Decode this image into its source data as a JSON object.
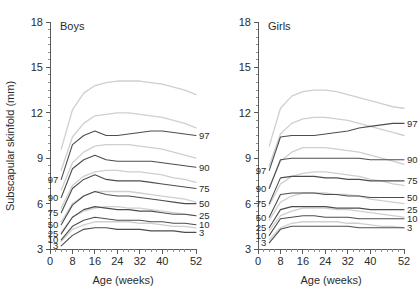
{
  "figure": {
    "ylabel": "Subscapular skinfold (mm)",
    "xlabel_boys": "Age (weeks)",
    "xlabel_girls": "Age (weeks)",
    "colors": {
      "main_curve": "#4d4d4d",
      "reference_curve": "#cfcfcf",
      "axis": "#5a5a5a",
      "text": "#2b2b2b",
      "background": "#ffffff"
    }
  },
  "panels": [
    {
      "id": "boys",
      "title": "Boys"
    },
    {
      "id": "girls",
      "title": "Girls"
    }
  ],
  "axes": {
    "y_ticks": [
      "3",
      "6",
      "9",
      "12",
      "15",
      "18"
    ],
    "y_tick_values": [
      3,
      6,
      9,
      12,
      15,
      18
    ],
    "y_minor_step": 0.5,
    "ylim": [
      3,
      18
    ],
    "x_ticks": [
      "0",
      "8",
      "16",
      "24",
      "32",
      "40",
      "52"
    ],
    "x_tick_values": [
      0,
      8,
      16,
      24,
      32,
      40,
      52
    ],
    "x_minor_step": 2,
    "xlim": [
      0,
      52
    ]
  },
  "percentile_labels": {
    "left": [
      "97",
      "90",
      "75",
      "50",
      "25",
      "10",
      "3"
    ],
    "right": [
      "97",
      "90",
      "75",
      "50",
      "25",
      "10",
      "3"
    ]
  },
  "chart_data": {
    "type": "line",
    "xlabel": "Age (weeks)",
    "ylabel": "Subscapular skinfold (mm)",
    "xlim": [
      0,
      52
    ],
    "ylim": [
      3,
      18
    ],
    "x_ticks": [
      0,
      8,
      16,
      24,
      32,
      40,
      52
    ],
    "y_ticks": [
      3,
      6,
      9,
      12,
      15,
      18
    ],
    "grid": false,
    "legend": "inline-percentile-labels",
    "x": [
      4,
      8,
      12,
      16,
      20,
      24,
      28,
      32,
      36,
      40,
      44,
      48,
      52
    ],
    "panels": [
      {
        "name": "Boys",
        "series": [
          {
            "name": "97",
            "kind": "main",
            "values": [
              7.6,
              9.9,
              10.5,
              10.8,
              10.5,
              10.5,
              10.6,
              10.7,
              10.8,
              10.8,
              10.7,
              10.6,
              10.5
            ]
          },
          {
            "name": "90",
            "kind": "main",
            "values": [
              6.4,
              8.3,
              8.9,
              9.2,
              8.9,
              8.8,
              8.8,
              8.8,
              8.8,
              8.7,
              8.6,
              8.5,
              8.4
            ]
          },
          {
            "name": "75",
            "kind": "main",
            "values": [
              5.4,
              7.0,
              7.6,
              7.9,
              7.6,
              7.5,
              7.5,
              7.5,
              7.4,
              7.3,
              7.2,
              7.1,
              7.0
            ]
          },
          {
            "name": "50",
            "kind": "main",
            "values": [
              4.6,
              5.9,
              6.5,
              6.8,
              6.6,
              6.5,
              6.5,
              6.4,
              6.3,
              6.2,
              6.1,
              6.0,
              6.0
            ]
          },
          {
            "name": "25",
            "kind": "main",
            "values": [
              4.0,
              5.1,
              5.6,
              5.8,
              5.7,
              5.6,
              5.6,
              5.5,
              5.5,
              5.4,
              5.3,
              5.3,
              5.2
            ]
          },
          {
            "name": "10",
            "kind": "main",
            "values": [
              3.6,
              4.5,
              4.9,
              5.1,
              5.0,
              4.9,
              4.9,
              4.9,
              4.8,
              4.8,
              4.7,
              4.7,
              4.6
            ]
          },
          {
            "name": "3",
            "kind": "main",
            "values": [
              3.2,
              3.9,
              4.3,
              4.4,
              4.4,
              4.3,
              4.3,
              4.3,
              4.2,
              4.2,
              4.2,
              4.1,
              4.1
            ]
          },
          {
            "name": "97-ref",
            "kind": "reference",
            "values": [
              9.6,
              12.2,
              13.3,
              13.8,
              14.0,
              14.1,
              14.1,
              14.1,
              14.0,
              13.9,
              13.7,
              13.5,
              13.2
            ]
          },
          {
            "name": "90-ref",
            "kind": "reference",
            "values": [
              8.2,
              10.4,
              11.3,
              11.8,
              11.9,
              12.0,
              12.0,
              11.9,
              11.8,
              11.7,
              11.5,
              11.3,
              11.0
            ]
          },
          {
            "name": "75-ref",
            "kind": "reference",
            "values": [
              6.9,
              8.7,
              9.4,
              9.8,
              9.9,
              9.9,
              9.9,
              9.8,
              9.7,
              9.6,
              9.4,
              9.2,
              9.0
            ]
          },
          {
            "name": "50-ref",
            "kind": "reference",
            "values": [
              5.7,
              7.2,
              7.8,
              8.1,
              8.2,
              8.2,
              8.1,
              8.1,
              8.0,
              7.9,
              7.7,
              7.6,
              7.4
            ]
          },
          {
            "name": "25-ref",
            "kind": "reference",
            "values": [
              4.8,
              6.0,
              6.5,
              6.8,
              6.8,
              6.8,
              6.8,
              6.7,
              6.6,
              6.5,
              6.4,
              6.3,
              6.1
            ]
          },
          {
            "name": "10-ref",
            "kind": "reference",
            "values": [
              4.1,
              5.1,
              5.5,
              5.7,
              5.8,
              5.8,
              5.7,
              5.7,
              5.6,
              5.5,
              5.4,
              5.3,
              5.2
            ]
          },
          {
            "name": "3-ref",
            "kind": "reference",
            "values": [
              3.5,
              4.3,
              4.6,
              4.8,
              4.8,
              4.8,
              4.8,
              4.7,
              4.7,
              4.6,
              4.5,
              4.5,
              4.4
            ]
          }
        ]
      },
      {
        "name": "Girls",
        "series": [
          {
            "name": "97",
            "kind": "main",
            "values": [
              8.2,
              10.4,
              10.5,
              10.5,
              10.5,
              10.6,
              10.7,
              10.8,
              11.0,
              11.1,
              11.2,
              11.3,
              11.3
            ]
          },
          {
            "name": "90",
            "kind": "main",
            "values": [
              7.0,
              8.9,
              9.0,
              9.0,
              9.0,
              9.0,
              9.0,
              9.0,
              9.0,
              8.9,
              8.9,
              8.9,
              8.9
            ]
          },
          {
            "name": "75",
            "kind": "main",
            "values": [
              6.0,
              7.7,
              7.8,
              7.8,
              7.8,
              7.7,
              7.7,
              7.6,
              7.6,
              7.5,
              7.5,
              7.5,
              7.5
            ]
          },
          {
            "name": "50",
            "kind": "main",
            "values": [
              5.1,
              6.6,
              6.7,
              6.7,
              6.7,
              6.6,
              6.6,
              6.5,
              6.5,
              6.4,
              6.4,
              6.4,
              6.4
            ]
          },
          {
            "name": "25",
            "kind": "main",
            "values": [
              4.4,
              5.6,
              5.8,
              5.8,
              5.8,
              5.8,
              5.7,
              5.7,
              5.7,
              5.6,
              5.6,
              5.6,
              5.6
            ]
          },
          {
            "name": "10",
            "kind": "main",
            "values": [
              3.9,
              5.0,
              5.1,
              5.2,
              5.2,
              5.1,
              5.1,
              5.1,
              5.0,
              5.0,
              5.0,
              5.0,
              5.0
            ]
          },
          {
            "name": "3",
            "kind": "main",
            "values": [
              3.4,
              4.3,
              4.5,
              4.5,
              4.5,
              4.5,
              4.5,
              4.5,
              4.4,
              4.4,
              4.4,
              4.4,
              4.4
            ]
          },
          {
            "name": "97-ref",
            "kind": "reference",
            "values": [
              9.8,
              12.3,
              13.1,
              13.4,
              13.5,
              13.5,
              13.4,
              13.2,
              13.0,
              12.8,
              12.6,
              12.4,
              12.3
            ]
          },
          {
            "name": "90-ref",
            "kind": "reference",
            "values": [
              8.5,
              10.6,
              11.3,
              11.6,
              11.7,
              11.7,
              11.6,
              11.5,
              11.3,
              11.1,
              10.9,
              10.7,
              10.5
            ]
          },
          {
            "name": "75-ref",
            "kind": "reference",
            "values": [
              7.1,
              8.8,
              9.4,
              9.7,
              9.7,
              9.7,
              9.6,
              9.5,
              9.4,
              9.2,
              9.0,
              8.8,
              8.6
            ]
          },
          {
            "name": "50-ref",
            "kind": "reference",
            "values": [
              5.9,
              7.3,
              7.8,
              8.0,
              8.1,
              8.1,
              8.0,
              7.9,
              7.8,
              7.6,
              7.5,
              7.3,
              7.2
            ]
          },
          {
            "name": "25-ref",
            "kind": "reference",
            "values": [
              4.9,
              6.1,
              6.5,
              6.7,
              6.7,
              6.7,
              6.6,
              6.6,
              6.5,
              6.3,
              6.2,
              6.1,
              6.0
            ]
          },
          {
            "name": "10-ref",
            "kind": "reference",
            "values": [
              4.2,
              5.2,
              5.5,
              5.7,
              5.7,
              5.7,
              5.6,
              5.6,
              5.5,
              5.4,
              5.3,
              5.2,
              5.1
            ]
          },
          {
            "name": "3-ref",
            "kind": "reference",
            "values": [
              3.6,
              4.4,
              4.7,
              4.8,
              4.8,
              4.8,
              4.8,
              4.7,
              4.7,
              4.6,
              4.5,
              4.5,
              4.4
            ]
          }
        ]
      }
    ]
  }
}
